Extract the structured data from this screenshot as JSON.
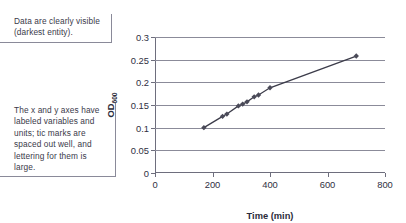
{
  "callouts": [
    {
      "id": "data-visibility-note",
      "text": "Data are clearly visible (darkest entity)."
    },
    {
      "id": "axis-labeling-note",
      "text": "The x and y axes have labeled variables and units; tic marks are spaced out well, and lettering for them is large."
    }
  ],
  "chart_data": {
    "type": "scatter",
    "title": "",
    "subtitle": "",
    "xlabel": "Time (min)",
    "ylabel": "OD",
    "ylabel_subscript": "600",
    "xlim": [
      0,
      800
    ],
    "ylim": [
      0,
      0.3
    ],
    "xticks": [
      0,
      200,
      400,
      600,
      800
    ],
    "yticks": [
      0,
      0.05,
      0.1,
      0.15,
      0.2,
      0.25,
      0.3
    ],
    "xtick_labels": [
      "0",
      "200",
      "400",
      "600",
      "800"
    ],
    "ytick_labels": [
      "0",
      "0.05",
      "0.1",
      "0.15",
      "0.2",
      "0.25",
      "0.3"
    ],
    "grid": "horizontal",
    "legend": "none",
    "marker_color": "#4a4a58",
    "line_color": "#3c3c4a",
    "grid_color": "#8b8b99",
    "series": [
      {
        "name": "growth curve",
        "x": [
          170,
          235,
          250,
          290,
          305,
          320,
          345,
          360,
          400,
          700
        ],
        "y": [
          0.1,
          0.125,
          0.13,
          0.148,
          0.152,
          0.157,
          0.168,
          0.172,
          0.188,
          0.258
        ]
      }
    ]
  }
}
